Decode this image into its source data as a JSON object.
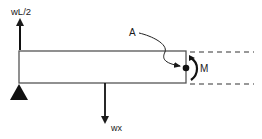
{
  "diagram": {
    "type": "free-body-diagram",
    "labels": {
      "reaction_force": "wL/2",
      "distributed_load_resultant": "wx",
      "point": "A",
      "moment": "M"
    },
    "colors": {
      "ink": "#1a1a1a",
      "background": "#ffffff"
    }
  }
}
